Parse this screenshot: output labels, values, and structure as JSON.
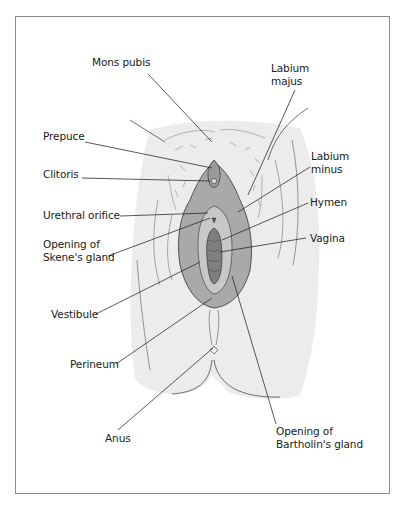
{
  "figure": {
    "labels": {
      "mons_pubis": "Mons pubis",
      "labium_majus": "Labium\nmajus",
      "prepuce": "Prepuce",
      "clitoris": "Clitoris",
      "labium_minus": "Labium\nminus",
      "urethral_orifice": "Urethral orifice",
      "hymen": "Hymen",
      "opening_skenes": "Opening of\nSkene's gland",
      "vagina": "Vagina",
      "vestibule": "Vestibule",
      "perineum": "Perineum",
      "anus": "Anus",
      "opening_bartholins": "Opening of\nBartholin's gland"
    },
    "colors": {
      "skin_shade": "#ececec",
      "labia_fill": "#a9a9a9",
      "inner_fill": "#c4c4c4",
      "vagina_fill": "#7e7e7e",
      "line": "#2a2a2a",
      "frame": "#8a8a8a"
    }
  }
}
